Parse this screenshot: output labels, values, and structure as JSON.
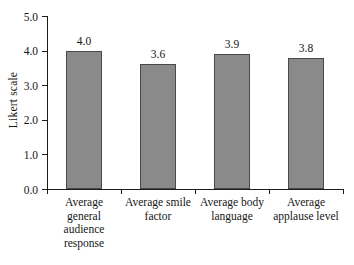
{
  "chart_data": {
    "type": "bar",
    "title": "",
    "subtitle": "",
    "xlabel": "",
    "ylabel": "Likert scale",
    "ylim": [
      0.0,
      5.0
    ],
    "ytick_labels": [
      "0.0",
      "1.0",
      "2.0",
      "3.0",
      "4.0",
      "5.0"
    ],
    "ytick_values": [
      0.0,
      1.0,
      2.0,
      3.0,
      4.0,
      5.0
    ],
    "grid": false,
    "legend": null,
    "bar_color": "#8a8a8a",
    "bar_edge_color": "#4a4a4a",
    "axis_color": "#1b1b1b",
    "categories": [
      "Average\ngeneral\naudience\nresponse",
      "Average smile\nfactor",
      "Average body\nlanguage",
      "Average\napplause level"
    ],
    "values": [
      4.0,
      3.6,
      3.9,
      3.8
    ],
    "value_labels": [
      "4.0",
      "3.6",
      "3.9",
      "3.8"
    ]
  }
}
